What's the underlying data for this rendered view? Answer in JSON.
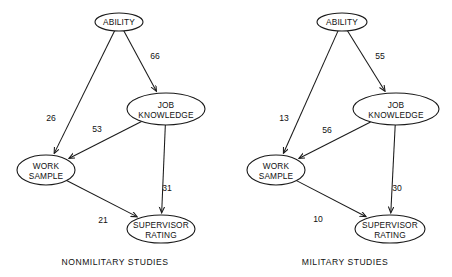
{
  "figure": {
    "background_color": "#ffffff",
    "line_color": "#1a1a1a",
    "text_color": "#111111"
  },
  "panels": [
    {
      "id": "nonmilitary",
      "caption": "NONMILITARY STUDIES",
      "nodes": [
        {
          "id": "ability",
          "label_line1": "ABILITY",
          "label_line2": "",
          "cx": 119,
          "cy": 22,
          "rx": 24,
          "ry": 9
        },
        {
          "id": "job",
          "label_line1": "JOB",
          "label_line2": "KNOWLEDGE",
          "cx": 166,
          "cy": 109,
          "rx": 39,
          "ry": 16
        },
        {
          "id": "work",
          "label_line1": "WORK",
          "label_line2": "SAMPLE",
          "cx": 46,
          "cy": 170,
          "rx": 29,
          "ry": 15
        },
        {
          "id": "supervisor",
          "label_line1": "SUPERVISOR",
          "label_line2": "RATING",
          "cx": 161,
          "cy": 229,
          "rx": 34,
          "ry": 14
        }
      ],
      "edges": [
        {
          "id": "ability-work",
          "from": "ability",
          "to": "work",
          "value": "26",
          "label_x": 51,
          "label_y": 121
        },
        {
          "id": "ability-job",
          "from": "ability",
          "to": "job",
          "value": "66",
          "label_x": 155,
          "label_y": 59
        },
        {
          "id": "job-work",
          "from": "job",
          "to": "work",
          "value": "53",
          "label_x": 97,
          "label_y": 132
        },
        {
          "id": "job-super",
          "from": "job",
          "to": "supervisor",
          "value": "31",
          "label_x": 167,
          "label_y": 191
        },
        {
          "id": "work-super",
          "from": "work",
          "to": "supervisor",
          "value": "21",
          "label_x": 103,
          "label_y": 223
        }
      ],
      "caption_x": 115,
      "caption_y": 265
    },
    {
      "id": "military",
      "caption": "MILITARY STUDIES",
      "nodes": [
        {
          "id": "ability",
          "label_line1": "ABILITY",
          "label_line2": "",
          "cx": 342,
          "cy": 22,
          "rx": 25,
          "ry": 9
        },
        {
          "id": "job",
          "label_line1": "JOB",
          "label_line2": "KNOWLEDGE",
          "cx": 396,
          "cy": 109,
          "rx": 43,
          "ry": 16
        },
        {
          "id": "work",
          "label_line1": "WORK",
          "label_line2": "SAMPLE",
          "cx": 276,
          "cy": 170,
          "rx": 29,
          "ry": 15
        },
        {
          "id": "supervisor",
          "label_line1": "SUPERVISOR",
          "label_line2": "RATING",
          "cx": 390,
          "cy": 229,
          "rx": 35,
          "ry": 14
        }
      ],
      "edges": [
        {
          "id": "ability-work",
          "from": "ability",
          "to": "work",
          "value": "13",
          "label_x": 284,
          "label_y": 121
        },
        {
          "id": "ability-job",
          "from": "ability",
          "to": "job",
          "value": "55",
          "label_x": 380,
          "label_y": 59
        },
        {
          "id": "job-work",
          "from": "job",
          "to": "work",
          "value": "56",
          "label_x": 327,
          "label_y": 133
        },
        {
          "id": "job-super",
          "from": "job",
          "to": "supervisor",
          "value": "30",
          "label_x": 397,
          "label_y": 191
        },
        {
          "id": "work-super",
          "from": "work",
          "to": "supervisor",
          "value": "10",
          "label_x": 318,
          "label_y": 222
        }
      ],
      "caption_x": 345,
      "caption_y": 265
    }
  ],
  "chart_data": {
    "type": "diagram",
    "diagram_kind": "path-analysis",
    "variables": [
      "ABILITY",
      "JOB KNOWLEDGE",
      "WORK SAMPLE",
      "SUPERVISOR RATING"
    ],
    "panels": [
      {
        "name": "NONMILITARY STUDIES",
        "paths": [
          {
            "from": "ABILITY",
            "to": "JOB KNOWLEDGE",
            "coefficient": 66
          },
          {
            "from": "ABILITY",
            "to": "WORK SAMPLE",
            "coefficient": 26
          },
          {
            "from": "JOB KNOWLEDGE",
            "to": "WORK SAMPLE",
            "coefficient": 53
          },
          {
            "from": "JOB KNOWLEDGE",
            "to": "SUPERVISOR RATING",
            "coefficient": 31
          },
          {
            "from": "WORK SAMPLE",
            "to": "SUPERVISOR RATING",
            "coefficient": 21
          }
        ]
      },
      {
        "name": "MILITARY STUDIES",
        "paths": [
          {
            "from": "ABILITY",
            "to": "JOB KNOWLEDGE",
            "coefficient": 55
          },
          {
            "from": "ABILITY",
            "to": "WORK SAMPLE",
            "coefficient": 13
          },
          {
            "from": "JOB KNOWLEDGE",
            "to": "WORK SAMPLE",
            "coefficient": 56
          },
          {
            "from": "JOB KNOWLEDGE",
            "to": "SUPERVISOR RATING",
            "coefficient": 30
          },
          {
            "from": "WORK SAMPLE",
            "to": "SUPERVISOR RATING",
            "coefficient": 10
          }
        ]
      }
    ]
  }
}
